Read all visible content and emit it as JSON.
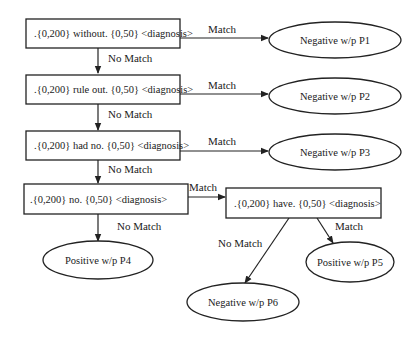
{
  "diagram": {
    "rules": [
      {
        "id": "r1",
        "label": ".{0,200} without. {0,50} <diagnosis>"
      },
      {
        "id": "r2",
        "label": ".{0,200} rule out. {0,50} <diagnosis>"
      },
      {
        "id": "r3",
        "label": ".{0,200} had no. {0,50} <diagnosis>"
      },
      {
        "id": "r4",
        "label": ".{0,200} no. {0,50} <diagnosis>"
      },
      {
        "id": "r5",
        "label": ".{0,200} have. {0,50} <diagnosis>"
      }
    ],
    "outcomes": [
      {
        "id": "p1",
        "label": "Negative w/p P1"
      },
      {
        "id": "p2",
        "label": "Negative w/p P2"
      },
      {
        "id": "p3",
        "label": "Negative w/p P3"
      },
      {
        "id": "p4",
        "label": "Positive w/p P4"
      },
      {
        "id": "p5",
        "label": "Positive w/p P5"
      },
      {
        "id": "p6",
        "label": "Negative w/p P6"
      }
    ],
    "edges": [
      {
        "from": "r1",
        "to": "p1",
        "label": "Match"
      },
      {
        "from": "r1",
        "to": "r2",
        "label": "No Match"
      },
      {
        "from": "r2",
        "to": "p2",
        "label": "Match"
      },
      {
        "from": "r2",
        "to": "r3",
        "label": "No Match"
      },
      {
        "from": "r3",
        "to": "p3",
        "label": "Match"
      },
      {
        "from": "r3",
        "to": "r4",
        "label": "No Match"
      },
      {
        "from": "r4",
        "to": "r5",
        "label": "Match"
      },
      {
        "from": "r4",
        "to": "p4",
        "label": "No Match"
      },
      {
        "from": "r5",
        "to": "p5",
        "label": "Match"
      },
      {
        "from": "r5",
        "to": "p6",
        "label": "No Match"
      }
    ]
  }
}
